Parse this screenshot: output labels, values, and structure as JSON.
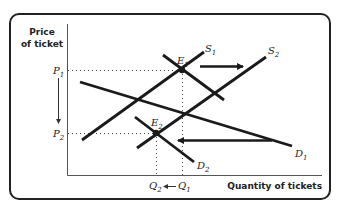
{
  "axes": {
    "y_title_line1": "Price",
    "y_title_line2": "of ticket",
    "x_title": "Quantity of tickets"
  },
  "curves": {
    "S1": {
      "label": "S",
      "sub": "1"
    },
    "S2": {
      "label": "S",
      "sub": "2"
    },
    "D1": {
      "label": "D",
      "sub": "1"
    },
    "D2": {
      "label": "D",
      "sub": "2"
    }
  },
  "points": {
    "E1": {
      "label": "E",
      "sub": "1"
    },
    "E2": {
      "label": "E",
      "sub": "2"
    }
  },
  "price_labels": {
    "P1": {
      "label": "P",
      "sub": "1"
    },
    "P2": {
      "label": "P",
      "sub": "2"
    }
  },
  "quantity_labels": {
    "Q1": {
      "label": "Q",
      "sub": "1"
    },
    "Q2": {
      "label": "Q",
      "sub": "2"
    }
  },
  "colors": {
    "line": "#1a1a1a",
    "frame": "#222222",
    "axis": "#555555"
  }
}
